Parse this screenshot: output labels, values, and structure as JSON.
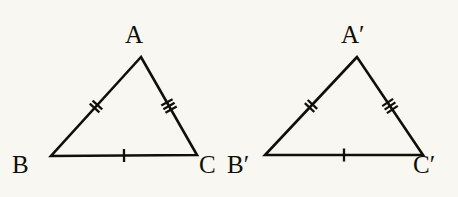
{
  "figure": {
    "kind": "geometry-diagram",
    "background_color": "#f8f7f1",
    "stroke_color": "#111008",
    "label_color": "#100f07"
  },
  "triangles": [
    {
      "id": "triangle-abc",
      "name": "ABC",
      "vertices": [
        {
          "key": "A",
          "label": "A",
          "x": 141,
          "y": 57,
          "label_x": 125,
          "label_y": 22
        },
        {
          "key": "B",
          "label": "B",
          "x": 51,
          "y": 156,
          "label_x": 12,
          "label_y": 152
        },
        {
          "key": "C",
          "label": "C",
          "x": 197,
          "y": 155,
          "label_x": 199,
          "label_y": 152
        }
      ],
      "sides": [
        {
          "id": "side-ab",
          "from": "A",
          "to": "B",
          "ticks": 2,
          "tick_position": 0.5
        },
        {
          "id": "side-ac",
          "from": "A",
          "to": "C",
          "ticks": 3,
          "tick_position": 0.5
        },
        {
          "id": "side-bc",
          "from": "B",
          "to": "C",
          "ticks": 1,
          "tick_position": 0.5
        }
      ]
    },
    {
      "id": "triangle-abc-prime",
      "name": "A'B'C'",
      "vertices": [
        {
          "key": "A'",
          "label": "A",
          "prime": "′",
          "x": 357,
          "y": 57,
          "label_x": 341,
          "label_y": 22
        },
        {
          "key": "B'",
          "label": "B",
          "prime": "′",
          "x": 265,
          "y": 155,
          "label_x": 227,
          "label_y": 152
        },
        {
          "key": "C'",
          "label": "C",
          "prime": "′",
          "x": 423,
          "y": 155,
          "label_x": 413,
          "label_y": 152
        }
      ],
      "sides": [
        {
          "id": "side-ab-prime",
          "from": "A'",
          "to": "B'",
          "ticks": 2,
          "tick_position": 0.5
        },
        {
          "id": "side-ac-prime",
          "from": "A'",
          "to": "C'",
          "ticks": 3,
          "tick_position": 0.5
        },
        {
          "id": "side-bc-prime",
          "from": "B'",
          "to": "C'",
          "ticks": 1,
          "tick_position": 0.5
        }
      ]
    }
  ],
  "tick_style": {
    "length": 13,
    "spacing": 4.2,
    "stroke_width": 2.3
  }
}
